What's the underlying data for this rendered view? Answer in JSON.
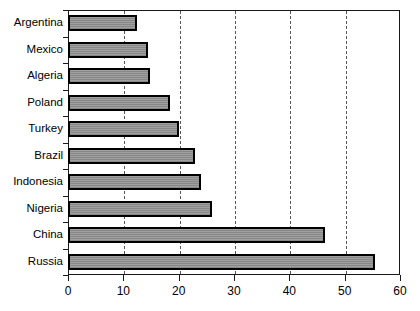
{
  "chart_data": {
    "type": "bar",
    "orientation": "horizontal",
    "title": "",
    "xlabel": "",
    "ylabel": "",
    "xlim": [
      0,
      60
    ],
    "xticks": [
      0,
      10,
      20,
      30,
      40,
      50,
      60
    ],
    "grid": "vertical-dashed",
    "legend": "none",
    "bar_color": "#8e8e8e",
    "bar_edge_color": "#000000",
    "axis_color": "#1a1a1a",
    "categories": [
      "Argentina",
      "Mexico",
      "Algeria",
      "Poland",
      "Turkey",
      "Brazil",
      "Indonesia",
      "Nigeria",
      "China",
      "Russia"
    ],
    "values": [
      12.5,
      14.5,
      14.8,
      18.5,
      20,
      23,
      24,
      26,
      46.5,
      55.5
    ]
  }
}
